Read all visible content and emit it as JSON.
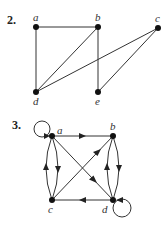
{
  "figures": [
    {
      "number": "2.",
      "type": "undirected",
      "vertices": [
        {
          "id": "a",
          "label": "a",
          "x": 36,
          "y": 27
        },
        {
          "id": "b",
          "label": "b",
          "x": 98,
          "y": 27
        },
        {
          "id": "c",
          "label": "c",
          "x": 158,
          "y": 28
        },
        {
          "id": "d",
          "label": "d",
          "x": 36,
          "y": 92
        },
        {
          "id": "e",
          "label": "e",
          "x": 98,
          "y": 92
        }
      ],
      "edges": [
        [
          "a",
          "b"
        ],
        [
          "a",
          "d"
        ],
        [
          "b",
          "d"
        ],
        [
          "b",
          "e"
        ],
        [
          "c",
          "d"
        ],
        [
          "c",
          "e"
        ]
      ]
    },
    {
      "number": "3.",
      "type": "directed",
      "vertices": [
        {
          "id": "a",
          "label": "a",
          "x": 52,
          "y": 136
        },
        {
          "id": "b",
          "label": "b",
          "x": 113,
          "y": 136
        },
        {
          "id": "c",
          "label": "c",
          "x": 52,
          "y": 200
        },
        {
          "id": "d",
          "label": "d",
          "x": 113,
          "y": 200
        }
      ],
      "edges": [
        {
          "from": "a",
          "to": "a",
          "kind": "loop"
        },
        {
          "from": "a",
          "to": "b"
        },
        {
          "from": "a",
          "to": "d"
        },
        {
          "from": "c",
          "to": "b"
        },
        {
          "from": "d",
          "to": "c"
        },
        {
          "from": "a",
          "to": "c",
          "kind": "curve-right"
        },
        {
          "from": "c",
          "to": "a",
          "kind": "curve-left"
        },
        {
          "from": "b",
          "to": "d",
          "kind": "curve-right"
        },
        {
          "from": "d",
          "to": "b",
          "kind": "curve-left"
        },
        {
          "from": "d",
          "to": "d",
          "kind": "loop"
        }
      ]
    }
  ]
}
